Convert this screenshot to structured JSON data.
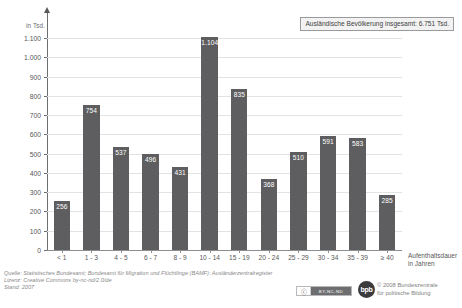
{
  "chart_data": {
    "type": "bar",
    "title": "",
    "xlabel": "Aufenthaltsdauer in Jahren",
    "ylabel": "in Tsd.",
    "ylim": [
      0,
      1100
    ],
    "grid": true,
    "legend": "none",
    "annotation": "Ausländische Bevölkerung insgesamt: 6.751 Tsd.",
    "categories": [
      "< 1",
      "1 - 3",
      "4 - 5",
      "6 - 7",
      "8 - 9",
      "10 - 14",
      "15 - 19",
      "20 - 24",
      "25 - 29",
      "30 - 34",
      "35 - 39",
      "≥ 40"
    ],
    "values": [
      256,
      754,
      537,
      496,
      431,
      1104,
      835,
      368,
      510,
      591,
      583,
      285
    ],
    "value_labels": [
      "256",
      "754",
      "537",
      "496",
      "431",
      "1.104",
      "835",
      "368",
      "510",
      "591",
      "583",
      "285"
    ],
    "ytick_values": [
      0,
      100,
      200,
      300,
      400,
      500,
      600,
      700,
      800,
      900,
      1000,
      1100
    ],
    "ytick_labels": [
      "0",
      "100",
      "200",
      "300",
      "400",
      "500",
      "600",
      "700",
      "800",
      "900",
      "1.000",
      "1.100"
    ],
    "bar_color": "#5e5e60",
    "grid_color": "#e3e3e4",
    "axis_color": "#8d8e90"
  },
  "axis": {
    "y_title": "in Tsd.",
    "x_title_line1": "Aufenthaltsdauer",
    "x_title_line2": "in Jahren"
  },
  "total_box": {
    "text": "Ausländische Bevölkerung insgesamt: 6.751 Tsd."
  },
  "footer": {
    "source": "Quelle: Statistisches Bundesamt; Bundesamt für Migration und Flüchtlinge (BAMF): Ausländerzentralregister",
    "license": "Lizenz: Creative Commons by-nc-nd/2.0/de",
    "status": "Stand: 2007"
  },
  "cc_badge": {
    "symbol": "ⓒ",
    "label": "BY-NC-ND"
  },
  "bpb": {
    "mark": "bpb",
    "line1": "© 2008 Bundeszentrale",
    "line2": "für politische Bildung"
  }
}
